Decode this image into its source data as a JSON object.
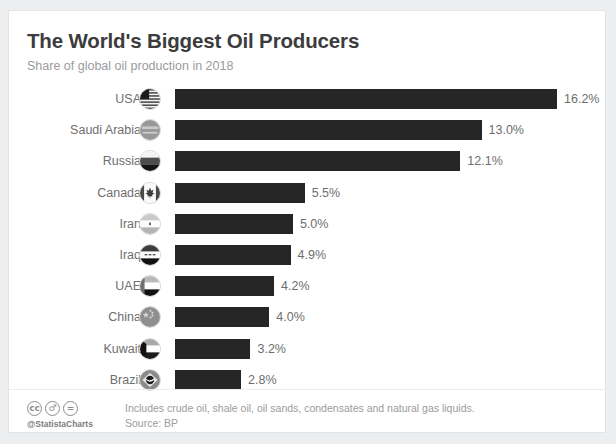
{
  "header": {
    "title": "The World's Biggest Oil Producers",
    "subtitle": "Share of global oil production in 2018"
  },
  "footer": {
    "cc_badges": [
      "cc",
      "person",
      "equals"
    ],
    "handle": "@StatistaCharts",
    "footnote": "Includes crude oil, shale oil, oil sands, condensates and natural gas liquids.",
    "source": "Source: BP"
  },
  "style": {
    "bar_color": "#262626",
    "label_color": "#6e6e6e",
    "title_color": "#3c3c3c",
    "subtitle_color": "#9b9b9b",
    "card_background": "#ffffff",
    "page_background": "#eceef0"
  },
  "chart_data": {
    "type": "bar",
    "orientation": "horizontal",
    "title": "The World's Biggest Oil Producers",
    "subtitle": "Share of global oil production in 2018",
    "xlabel": "",
    "ylabel": "",
    "grid": false,
    "legend": "none",
    "xlim": [
      0,
      16.2
    ],
    "categories": [
      "USA",
      "Saudi Arabia",
      "Russia",
      "Canada",
      "Iran",
      "Iraq",
      "UAE",
      "China",
      "Kuwait",
      "Brazil"
    ],
    "values": [
      16.2,
      13.0,
      12.1,
      5.5,
      5.0,
      4.9,
      4.2,
      4.0,
      3.2,
      2.8
    ],
    "value_labels": [
      "16.2%",
      "13.0%",
      "12.1%",
      "5.5%",
      "5.0%",
      "4.9%",
      "4.2%",
      "4.0%",
      "3.2%",
      "2.8%"
    ],
    "icons": [
      "flag-usa-icon",
      "flag-saudi-arabia-icon",
      "flag-russia-icon",
      "flag-canada-icon",
      "flag-iran-icon",
      "flag-iraq-icon",
      "flag-uae-icon",
      "flag-china-icon",
      "flag-kuwait-icon",
      "flag-brazil-icon"
    ],
    "unit": "%",
    "source": "BP",
    "note": "Includes crude oil, shale oil, oil sands, condensates and natural gas liquids."
  }
}
